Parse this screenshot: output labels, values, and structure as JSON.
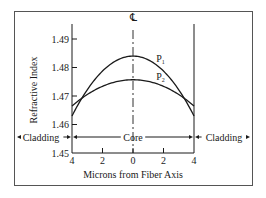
{
  "chart_data": {
    "type": "line",
    "title": "",
    "xlabel": "Microns from Fiber Axis",
    "ylabel": "Refractive Index",
    "xlim": [
      -4,
      4
    ],
    "ylim": [
      1.45,
      1.49
    ],
    "x_ticks": [
      -4,
      -2,
      0,
      2,
      4
    ],
    "x_tick_labels": [
      "4",
      "2",
      "0",
      "2",
      "4"
    ],
    "y_ticks": [
      1.45,
      1.46,
      1.47,
      1.48,
      1.49
    ],
    "y_tick_labels": [
      "1.45",
      "1.46",
      "1.47",
      "1.48",
      "1.49"
    ],
    "grid": false,
    "centerline_label": "℄",
    "series": [
      {
        "name": "P1",
        "label_main": "P",
        "label_sub": "1",
        "shape": "parabolic",
        "x": [
          -4,
          -3,
          -2,
          -1,
          0,
          1,
          2,
          3,
          4
        ],
        "y": [
          1.463,
          1.4712,
          1.4774,
          1.4817,
          1.484,
          1.4817,
          1.4774,
          1.4712,
          1.463
        ]
      },
      {
        "name": "P2",
        "label_main": "P",
        "label_sub": "2",
        "shape": "parabolic",
        "x": [
          -4,
          -3,
          -2,
          -1,
          0,
          1,
          2,
          3,
          4
        ],
        "y": [
          1.4665,
          1.4702,
          1.4732,
          1.475,
          1.4757,
          1.475,
          1.4732,
          1.4702,
          1.4665
        ]
      }
    ],
    "regions": [
      {
        "name": "Cladding",
        "side": "left"
      },
      {
        "name": "Core",
        "side": "center"
      },
      {
        "name": "Cladding",
        "side": "right"
      }
    ]
  }
}
